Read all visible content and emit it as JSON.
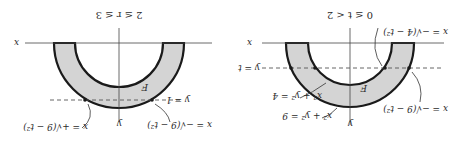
{
  "orientation": "rotated-180",
  "colors": {
    "region_fill": "#d4d4d4",
    "outline": "#1a1a1a",
    "axis": "#444444",
    "dashed": "#555555",
    "text": "#2a2a2a"
  },
  "panels": [
    {
      "id": "left",
      "caption": "2 ≤ r ≤ 3",
      "region_label": "F",
      "x_axis_label": "x",
      "y_axis_label": "y",
      "dashed_label": "y = 1",
      "curve_label_left": "x = +√(9 − t²)",
      "curve_label_right": "x = −√(9 − t²)"
    },
    {
      "id": "right",
      "caption": "0 ≤ t < 2",
      "region_label": "F",
      "x_axis_label": "x",
      "y_axis_label": "y",
      "dashed_label": "y = t",
      "top_label": "x = −√(4 − t²)",
      "side_label": "x = −√(9 − t²)",
      "inner_circle_label": "x² + y² = 4",
      "outer_circle_label": "x² + y² = 9"
    }
  ]
}
